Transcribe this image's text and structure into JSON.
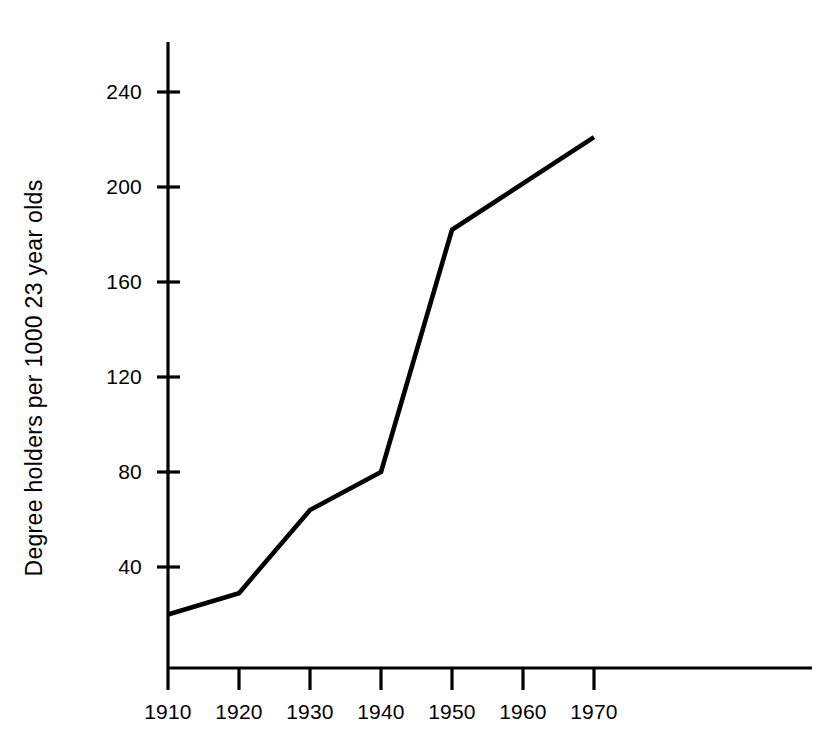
{
  "chart_data": {
    "type": "line",
    "title": "",
    "xlabel": "",
    "ylabel": "Degree holders per 1000 23 year olds",
    "x": [
      1910,
      1920,
      1930,
      1940,
      1950,
      1970
    ],
    "values": [
      20,
      29,
      64,
      80,
      182,
      221
    ],
    "series": [
      {
        "name": "Degree holders per 1000 23 year olds",
        "values": [
          20,
          29,
          64,
          80,
          182,
          221
        ]
      }
    ],
    "xlim": [
      1905,
      1977
    ],
    "ylim": [
      0,
      262
    ],
    "xticks": [
      1910,
      1920,
      1930,
      1940,
      1950,
      1960,
      1970
    ],
    "yticks": [
      40,
      80,
      120,
      160,
      200,
      240
    ],
    "xticklabels": [
      "1910",
      "1920",
      "1930",
      "1940",
      "1950",
      "1960",
      "1970"
    ],
    "yticklabels": [
      "40",
      "80",
      "120",
      "160",
      "200",
      "240"
    ],
    "grid": false,
    "legend": false,
    "legend_position": "none",
    "line_color": "#000000",
    "background_color": "#ffffff",
    "axis_color": "#000000"
  },
  "axis": {
    "y_title": "Degree holders per 1000 23 year olds",
    "y_ticks": [
      {
        "label": "240",
        "value": 240
      },
      {
        "label": "200",
        "value": 200
      },
      {
        "label": "160",
        "value": 160
      },
      {
        "label": "120",
        "value": 120
      },
      {
        "label": "80",
        "value": 80
      },
      {
        "label": "40",
        "value": 40
      }
    ],
    "x_ticks": [
      {
        "label": "1910",
        "value": 1910
      },
      {
        "label": "1920",
        "value": 1920
      },
      {
        "label": "1930",
        "value": 1930
      },
      {
        "label": "1940",
        "value": 1940
      },
      {
        "label": "1950",
        "value": 1950
      },
      {
        "label": "1960",
        "value": 1960
      },
      {
        "label": "1970",
        "value": 1970
      }
    ]
  }
}
